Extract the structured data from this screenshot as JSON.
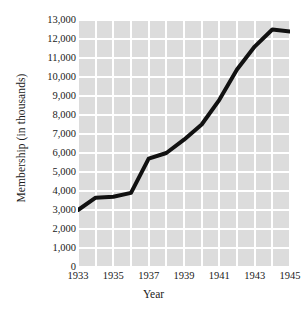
{
  "chart_data": {
    "type": "line",
    "title": "",
    "xlabel": "Year",
    "ylabel": "Membership (in thousands)",
    "x": [
      1933,
      1934,
      1935,
      1936,
      1937,
      1938,
      1939,
      1940,
      1941,
      1942,
      1943,
      1944,
      1945
    ],
    "values": [
      3000,
      3650,
      3700,
      3900,
      5700,
      6000,
      6700,
      7500,
      8800,
      10400,
      11600,
      12500,
      12400
    ],
    "series": [
      {
        "name": "Membership",
        "values": [
          3000,
          3650,
          3700,
          3900,
          5700,
          6000,
          6700,
          7500,
          8800,
          10400,
          11600,
          12500,
          12400
        ]
      }
    ],
    "xlim": [
      1933,
      1945
    ],
    "ylim": [
      0,
      13000
    ],
    "ytick_values": [
      0,
      1000,
      2000,
      3000,
      4000,
      5000,
      6000,
      7000,
      8000,
      9000,
      10000,
      11000,
      12000,
      13000
    ],
    "ytick_labels": [
      "0",
      "1,000",
      "2,000",
      "3,000",
      "4,000",
      "5,000",
      "6,000",
      "7,000",
      "8,000",
      "9,000",
      "10,000",
      "11,000",
      "12,000",
      "13,000"
    ],
    "xtick_values": [
      1933,
      1935,
      1937,
      1939,
      1941,
      1943,
      1945
    ],
    "xtick_labels": [
      "1933",
      "1935",
      "1937",
      "1939",
      "1941",
      "1943",
      "1945"
    ],
    "grid": true,
    "grid_x": true,
    "grid_y": true,
    "legend": false,
    "legend_position": "none",
    "plot_background_color": "#dcdcdc",
    "gridline_color": "#ffffff",
    "line_color": "#111111",
    "line_width": 4,
    "figure_background_color": "#ffffff"
  }
}
